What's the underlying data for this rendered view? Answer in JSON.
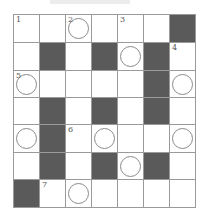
{
  "puzzle": {
    "rows": 7,
    "cols": 7,
    "colors": {
      "block": "#5a5a5a",
      "border": "#9a9a9a",
      "circle": "#8a8a8a"
    },
    "grid": [
      [
        {
          "n": "1"
        },
        {},
        {
          "n": "2",
          "c": true
        },
        {},
        {
          "n": "3"
        },
        {},
        {
          "b": true
        }
      ],
      [
        {},
        {
          "b": true
        },
        {},
        {
          "b": true
        },
        {
          "c": true
        },
        {
          "b": true
        },
        {
          "n": "4"
        }
      ],
      [
        {
          "n": "5",
          "c": true
        },
        {},
        {},
        {},
        {},
        {
          "b": true
        },
        {
          "c": true
        }
      ],
      [
        {},
        {
          "b": true
        },
        {},
        {
          "b": true
        },
        {},
        {
          "b": true
        },
        {}
      ],
      [
        {
          "c": true
        },
        {
          "b": true
        },
        {
          "n": "6"
        },
        {
          "c": true
        },
        {},
        {},
        {
          "c": true
        }
      ],
      [
        {},
        {
          "b": true
        },
        {},
        {
          "b": true
        },
        {
          "c": true
        },
        {
          "b": true
        },
        {}
      ],
      [
        {
          "b": true
        },
        {
          "n": "7"
        },
        {
          "c": true
        },
        {},
        {},
        {},
        {}
      ]
    ]
  }
}
